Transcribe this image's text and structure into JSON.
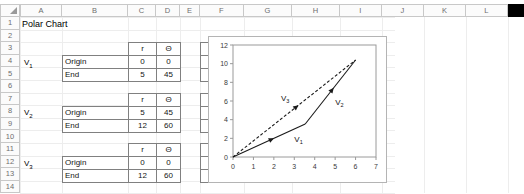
{
  "app": {
    "type": "spreadsheet",
    "title": "Polar Chart"
  },
  "grid": {
    "column_headers": [
      "A",
      "B",
      "C",
      "D",
      "E",
      "F",
      "G",
      "H",
      "I",
      "J",
      "K",
      "L"
    ],
    "row_headers": [
      "1",
      "2",
      "3",
      "4",
      "5",
      "6",
      "7",
      "8",
      "9",
      "10",
      "11",
      "12",
      "13",
      "14"
    ],
    "corner_name": "select-all-corner"
  },
  "cells": {
    "a1_title": "Polar Chart"
  },
  "vectors": [
    {
      "name": "V",
      "subscript": "1",
      "row_label": "V1",
      "headers": {
        "polar": [
          "r",
          "Θ"
        ],
        "cartesian": [
          "x",
          "y"
        ]
      },
      "rows": [
        {
          "label": "Origin",
          "r": "0",
          "theta": "0",
          "x": "0",
          "y": "0"
        },
        {
          "label": "End",
          "r": "5",
          "theta": "45",
          "x": "3.536",
          "y": "3.536"
        }
      ]
    },
    {
      "name": "V",
      "subscript": "2",
      "row_label": "V2",
      "headers": {
        "polar": [
          "r",
          "Θ"
        ],
        "cartesian": [
          "x",
          "y"
        ]
      },
      "rows": [
        {
          "label": "Origin",
          "r": "5",
          "theta": "45",
          "x": "3.5355",
          "y": "3.536"
        },
        {
          "label": "End",
          "r": "12",
          "theta": "60",
          "x": "6.000",
          "y": "10.392"
        }
      ]
    },
    {
      "name": "V",
      "subscript": "3",
      "row_label": "V3",
      "headers": {
        "polar": [
          "r",
          "Θ"
        ],
        "cartesian": [
          "x",
          "y"
        ]
      },
      "rows": [
        {
          "label": "Origin",
          "r": "0",
          "theta": "0",
          "x": "0",
          "y": "0"
        },
        {
          "label": "End",
          "r": "12",
          "theta": "60",
          "x": "6.000",
          "y": "10.392"
        }
      ]
    }
  ],
  "chart_data": {
    "type": "line",
    "title": "",
    "xlabel": "",
    "ylabel": "",
    "xlim": [
      0,
      7
    ],
    "ylim": [
      0,
      12
    ],
    "xticks": [
      0,
      1,
      2,
      3,
      4,
      5,
      6,
      7
    ],
    "yticks": [
      0,
      2,
      4,
      6,
      8,
      10,
      12
    ],
    "grid": false,
    "legend": "none",
    "series": [
      {
        "name": "V1",
        "label": "V",
        "label_sub": "1",
        "style": "solid-arrow",
        "color": "#1a1a1a",
        "points": [
          [
            0,
            0
          ],
          [
            3.536,
            3.536
          ]
        ],
        "label_pos": [
          3.0,
          1.6
        ]
      },
      {
        "name": "V2",
        "label": "V",
        "label_sub": "2",
        "style": "solid-arrow",
        "color": "#1a1a1a",
        "points": [
          [
            3.536,
            3.536
          ],
          [
            6.0,
            10.392
          ]
        ],
        "label_pos": [
          5.0,
          5.6
        ]
      },
      {
        "name": "V3",
        "label": "V",
        "label_sub": "3",
        "style": "dashed-arrow",
        "color": "#1a1a1a",
        "points": [
          [
            0,
            0
          ],
          [
            6.0,
            10.392
          ]
        ],
        "label_pos": [
          2.35,
          6.0
        ]
      }
    ]
  }
}
